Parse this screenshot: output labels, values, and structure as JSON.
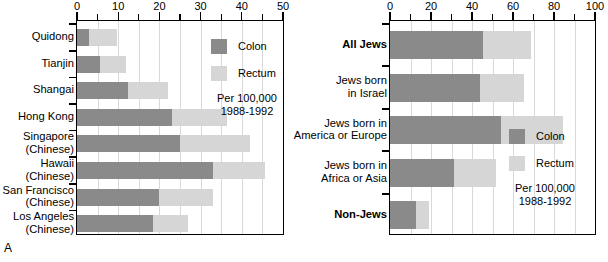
{
  "figure": {
    "panel_a_letter": "A",
    "panel_b_letter": "B"
  },
  "legend": {
    "colon_label": "Colon",
    "rectum_label": "Rectum",
    "note_line1": "Per 100,000",
    "note_line2": "1988-1992",
    "colon_color": "#8a8a8a",
    "rectum_color": "#d6d6d6"
  },
  "chart_data": [
    {
      "id": "panel-a",
      "type": "bar",
      "orientation": "horizontal",
      "title": "",
      "xlabel": "",
      "ylabel": "",
      "xlim": [
        0,
        50
      ],
      "ticks": [
        0,
        10,
        20,
        30,
        40,
        50
      ],
      "minor_tick_step": 5,
      "grid": true,
      "legend_position": "top-right-inside",
      "categories": [
        "Quidong",
        "Tianjin",
        "Shangai",
        "Hong Kong",
        "Singapore\n(Chinese)",
        "Hawaii\n(Chinese)",
        "San Francisco\n(Chinese)",
        "Los Angeles\n(Chinese)"
      ],
      "category_lines": [
        [
          "Quidong"
        ],
        [
          "Tianjin"
        ],
        [
          "Shangai"
        ],
        [
          "Hong Kong"
        ],
        [
          "Singapore",
          "(Chinese)"
        ],
        [
          "Hawaii",
          "(Chinese)"
        ],
        [
          "San Francisco",
          "(Chinese)"
        ],
        [
          "Los Angeles",
          "(Chinese)"
        ]
      ],
      "bold_categories": [],
      "series": [
        {
          "name": "Colon",
          "values": [
            2.9,
            5.5,
            12.3,
            23.0,
            25.0,
            33.0,
            20.0,
            18.5
          ]
        },
        {
          "name": "Rectum",
          "values": [
            6.8,
            6.3,
            9.7,
            13.5,
            17.0,
            12.6,
            13.0,
            8.5
          ]
        }
      ],
      "totals": [
        9.7,
        11.8,
        22.0,
        36.5,
        42.0,
        45.6,
        33.0,
        27.0
      ]
    },
    {
      "id": "panel-b",
      "type": "bar",
      "orientation": "horizontal",
      "title": "",
      "xlabel": "",
      "ylabel": "",
      "xlim": [
        0,
        100
      ],
      "ticks": [
        0,
        20,
        40,
        60,
        80,
        100
      ],
      "minor_tick_step": 10,
      "grid": true,
      "legend_position": "bottom-right-inside",
      "categories": [
        "All Jews",
        "Jews born\nin Israel",
        "Jews born in\nAmerica or Europe",
        "Jews born in\nAfrica or Asia",
        "Non-Jews"
      ],
      "category_lines": [
        [
          "All Jews"
        ],
        [
          "Jews born",
          "in Israel"
        ],
        [
          "Jews born in",
          "America or Europe"
        ],
        [
          "Jews born in",
          "Africa or Asia"
        ],
        [
          "Non-Jews"
        ]
      ],
      "bold_categories": [
        "All Jews",
        "Non-Jews"
      ],
      "series": [
        {
          "name": "Colon",
          "values": [
            45.6,
            44.0,
            54.0,
            31.0,
            12.5
          ]
        },
        {
          "name": "Rectum",
          "values": [
            23.4,
            21.5,
            30.5,
            20.5,
            6.5
          ]
        }
      ],
      "totals": [
        69.0,
        65.5,
        84.5,
        51.5,
        19.0
      ]
    }
  ]
}
